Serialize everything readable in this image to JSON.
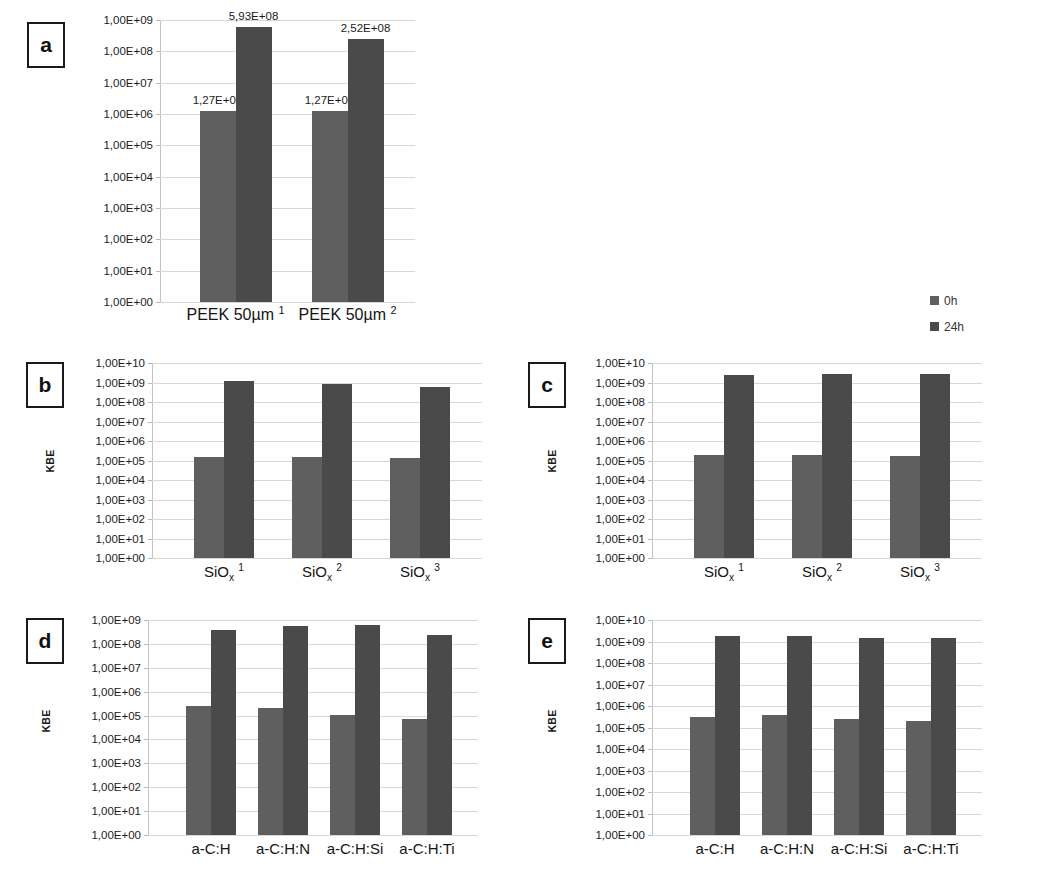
{
  "figure": {
    "legend": {
      "position": "right-middle",
      "entries": [
        {
          "label": "0h",
          "color": "#5f5f5f"
        },
        {
          "label": "24h",
          "color": "#4a4a4a"
        }
      ]
    }
  },
  "chart_data": [
    {
      "id": "a",
      "panel_letter": "a",
      "type": "bar",
      "title": "",
      "xlabel": "",
      "ylabel": "",
      "yscale": "log",
      "ylim": [
        1,
        1000000000
      ],
      "ytick_labels": [
        "1,00E+09",
        "1,00E+08",
        "1,00E+07",
        "1,00E+06",
        "1,00E+05",
        "1,00E+04",
        "1,00E+03",
        "1,00E+02",
        "1,00E+01",
        "1,00E+00"
      ],
      "ytick_exponents": [
        9,
        8,
        7,
        6,
        5,
        4,
        3,
        2,
        1,
        0
      ],
      "grid": true,
      "categories": [
        "PEEK 50µm 1",
        "PEEK 50µm 2"
      ],
      "category_html": [
        "PEEK 50µm <sup>1</sup>",
        "PEEK 50µm <sup>2</sup>"
      ],
      "series": [
        {
          "name": "0h",
          "color": "#5f5f5f",
          "values": [
            1270000,
            1270000
          ],
          "value_labels": [
            "1,27E+06",
            "1,27E+06"
          ]
        },
        {
          "name": "24h",
          "color": "#4a4a4a",
          "values": [
            593000000,
            252000000
          ],
          "value_labels": [
            "5,93E+08",
            "2,52E+08"
          ]
        }
      ],
      "has_value_labels": true
    },
    {
      "id": "b",
      "panel_letter": "b",
      "type": "bar",
      "title": "",
      "xlabel": "",
      "ylabel": "KBE",
      "yscale": "log",
      "ylim": [
        1,
        10000000000
      ],
      "ytick_labels": [
        "1,00E+10",
        "1,00E+09",
        "1,00E+08",
        "1,00E+07",
        "1,00E+06",
        "1,00E+05",
        "1,00E+04",
        "1,00E+03",
        "1,00E+02",
        "1,00E+01",
        "1,00E+00"
      ],
      "ytick_exponents": [
        10,
        9,
        8,
        7,
        6,
        5,
        4,
        3,
        2,
        1,
        0
      ],
      "grid": true,
      "categories": [
        "SiOx 1",
        "SiOx 2",
        "SiOx 3"
      ],
      "category_html": [
        "SiO<sub>x</sub> <sup>1</sup>",
        "SiO<sub>x</sub> <sup>2</sup>",
        "SiO<sub>x</sub> <sup>3</sup>"
      ],
      "series": [
        {
          "name": "0h",
          "color": "#5f5f5f",
          "values": [
            160000,
            150000,
            130000
          ]
        },
        {
          "name": "24h",
          "color": "#4a4a4a",
          "values": [
            1200000000,
            800000000,
            600000000
          ]
        }
      ],
      "has_value_labels": false
    },
    {
      "id": "c",
      "panel_letter": "c",
      "type": "bar",
      "title": "",
      "xlabel": "",
      "ylabel": "KBE",
      "yscale": "log",
      "ylim": [
        1,
        10000000000
      ],
      "ytick_labels": [
        "1,00E+10",
        "1,00E+09",
        "1,00E+08",
        "1,00E+07",
        "1,00E+06",
        "1,00E+05",
        "1,00E+04",
        "1,00E+03",
        "1,00E+02",
        "1,00E+01",
        "1,00E+00"
      ],
      "ytick_exponents": [
        10,
        9,
        8,
        7,
        6,
        5,
        4,
        3,
        2,
        1,
        0
      ],
      "grid": true,
      "categories": [
        "SiOx 1",
        "SiOx 2",
        "SiOx 3"
      ],
      "category_html": [
        "SiO<sub>x</sub> <sup>1</sup>",
        "SiO<sub>x</sub> <sup>2</sup>",
        "SiO<sub>x</sub> <sup>3</sup>"
      ],
      "series": [
        {
          "name": "0h",
          "color": "#5f5f5f",
          "values": [
            200000,
            190000,
            180000
          ]
        },
        {
          "name": "24h",
          "color": "#4a4a4a",
          "values": [
            2500000000,
            2800000000,
            2600000000
          ]
        }
      ],
      "has_value_labels": false
    },
    {
      "id": "d",
      "panel_letter": "d",
      "type": "bar",
      "title": "",
      "xlabel": "",
      "ylabel": "KBE",
      "yscale": "log",
      "ylim": [
        1,
        1000000000
      ],
      "ytick_labels": [
        "1,00E+09",
        "1,00E+08",
        "1,00E+07",
        "1,00E+06",
        "1,00E+05",
        "1,00E+04",
        "1,00E+03",
        "1,00E+02",
        "1,00E+01",
        "1,00E+00"
      ],
      "ytick_exponents": [
        9,
        8,
        7,
        6,
        5,
        4,
        3,
        2,
        1,
        0
      ],
      "grid": true,
      "categories": [
        "a-C:H",
        "a-C:H:N",
        "a-C:H:Si",
        "a-C:H:Ti"
      ],
      "category_html": [
        "a-C:H",
        "a-C:H:N",
        "a-C:H:Si",
        "a-C:H:Ti"
      ],
      "series": [
        {
          "name": "0h",
          "color": "#5f5f5f",
          "values": [
            250000,
            200000,
            110000,
            70000
          ]
        },
        {
          "name": "24h",
          "color": "#4a4a4a",
          "values": [
            400000000,
            550000000,
            620000000,
            230000000
          ]
        }
      ],
      "has_value_labels": false
    },
    {
      "id": "e",
      "panel_letter": "e",
      "type": "bar",
      "title": "",
      "xlabel": "",
      "ylabel": "KBE",
      "yscale": "log",
      "ylim": [
        1,
        10000000000
      ],
      "ytick_labels": [
        "1,00E+10",
        "1,00E+09",
        "1,00E+08",
        "1,00E+07",
        "1,00E+06",
        "1,00E+05",
        "1,00E+04",
        "1,00E+03",
        "1,00E+02",
        "1,00E+01",
        "1,00E+00"
      ],
      "ytick_exponents": [
        10,
        9,
        8,
        7,
        6,
        5,
        4,
        3,
        2,
        1,
        0
      ],
      "grid": true,
      "categories": [
        "a-C:H",
        "a-C:H:N",
        "a-C:H:Si",
        "a-C:H:Ti"
      ],
      "category_html": [
        "a-C:H",
        "a-C:H:N",
        "a-C:H:Si",
        "a-C:H:Ti"
      ],
      "series": [
        {
          "name": "0h",
          "color": "#5f5f5f",
          "values": [
            300000,
            380000,
            260000,
            210000
          ]
        },
        {
          "name": "24h",
          "color": "#4a4a4a",
          "values": [
            1800000000,
            1800000000,
            1400000000,
            1400000000
          ]
        }
      ],
      "has_value_labels": false
    }
  ]
}
